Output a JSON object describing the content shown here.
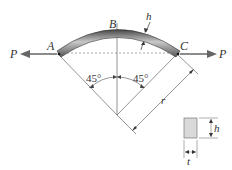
{
  "diagram": {
    "points": {
      "A": "A",
      "B": "B",
      "C": "C"
    },
    "load_left": "P",
    "load_right": "P",
    "angle_left": "45°",
    "angle_right": "45°",
    "radius_label": "r",
    "thickness_top": "h",
    "cross_section": {
      "height": "h",
      "width": "t"
    }
  },
  "colors": {
    "bar_dark": "#555555",
    "bar_light": "#b8b8b8",
    "arrow": "#666666",
    "section_fill": "#d9d9d9"
  }
}
